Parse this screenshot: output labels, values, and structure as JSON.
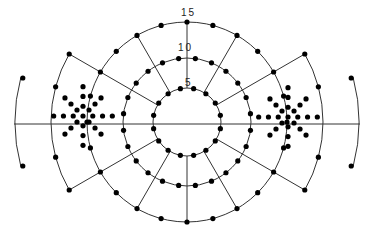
{
  "diagram": {
    "center": [
      187,
      122
    ],
    "radii": {
      "inner": 34,
      "middle": 64,
      "outer": 100,
      "wing": 136,
      "far_arc": 172
    },
    "labels": [
      {
        "text": "15",
        "x": 181,
        "y": 16
      },
      {
        "text": "10",
        "x": 178,
        "y": 51
      },
      {
        "text": "5",
        "x": 185,
        "y": 86
      }
    ],
    "spoke_angles_deg": [
      30,
      60,
      120,
      150,
      210,
      240,
      300,
      330
    ],
    "inner_dots": {
      "count": 16,
      "offset_deg": 11.25
    },
    "middle_dots": {
      "count": 24,
      "offset_deg": 7.5
    },
    "outer_dots": {
      "count": 24,
      "offset_deg": 0
    },
    "wing_dot_angles_deg": [
      150,
      165,
      195,
      210,
      30,
      15,
      345,
      330
    ],
    "far_arc": {
      "span_deg": 15,
      "dot_angles_deg": [
        165,
        195,
        15,
        345
      ]
    },
    "stars": [
      {
        "name": "left-star",
        "center": [
          83,
          116
        ]
      },
      {
        "name": "right-star",
        "center": [
          288,
          117
        ]
      }
    ],
    "star_step": 8.5,
    "star_rays": 8,
    "star_dots_per_ray": 3,
    "colors": {
      "line": "#333333",
      "dot": "#000000",
      "background": "#ffffff"
    }
  }
}
